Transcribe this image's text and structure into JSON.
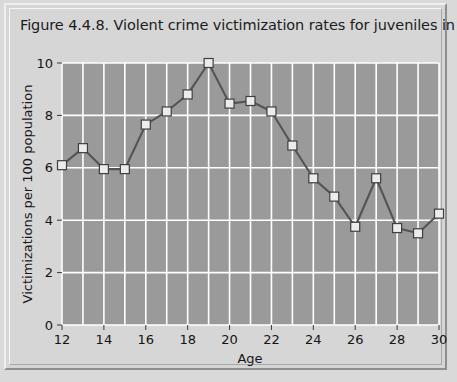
{
  "figure": {
    "title": "Figure 4.4.8. Violent crime victimization rates for juveniles in 1991."
  },
  "chart_data": {
    "type": "line",
    "title": "Figure 4.4.8. Violent crime victimization rates for juveniles in 1991.",
    "xlabel": "Age",
    "ylabel": "Victimizations per 100 population",
    "x": [
      12,
      13,
      14,
      15,
      16,
      17,
      18,
      19,
      20,
      21,
      22,
      23,
      24,
      25,
      26,
      27,
      28,
      29,
      30
    ],
    "values": [
      6.1,
      6.75,
      5.95,
      5.95,
      7.65,
      8.15,
      8.8,
      10.0,
      8.45,
      8.55,
      8.15,
      6.85,
      5.6,
      4.9,
      3.75,
      5.6,
      3.7,
      3.5,
      4.25
    ],
    "series": [
      {
        "name": "Violent crime victimization rate",
        "values": [
          6.1,
          6.75,
          5.95,
          5.95,
          7.65,
          8.15,
          8.8,
          10.0,
          8.45,
          8.55,
          8.15,
          6.85,
          5.6,
          4.9,
          3.75,
          5.6,
          3.7,
          3.5,
          4.25
        ]
      }
    ],
    "xlim": [
      12,
      30
    ],
    "ylim": [
      0,
      10
    ],
    "xticks": [
      12,
      14,
      16,
      18,
      20,
      22,
      24,
      26,
      28,
      30
    ],
    "yticks": [
      0,
      2,
      4,
      6,
      8,
      10
    ],
    "xtick_labels": [
      "12",
      "14",
      "16",
      "18",
      "20",
      "22",
      "24",
      "26",
      "28",
      "30"
    ],
    "ytick_labels": [
      "0",
      "2",
      "4",
      "6",
      "8",
      "10"
    ],
    "grid": true,
    "grid_color": "#ffffff",
    "legend": null,
    "plot_background": "#9a9a9a",
    "figure_background": "#d6d6d6",
    "line_color": "#545454",
    "marker_color": "#ececec",
    "marker_shape": "square"
  }
}
